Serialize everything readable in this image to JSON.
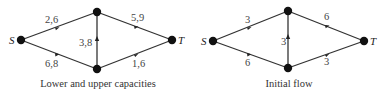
{
  "diagrams": [
    {
      "caption": "Lower and upper capacities",
      "nodes": [
        {
          "id": "S",
          "label": "S",
          "x": 21,
          "y": 40
        },
        {
          "id": "A",
          "label": "",
          "x": 97,
          "y": 12
        },
        {
          "id": "B",
          "label": "",
          "x": 97,
          "y": 69
        },
        {
          "id": "T",
          "label": "T",
          "x": 172,
          "y": 40
        }
      ],
      "edges": [
        {
          "from": "S",
          "to": "A",
          "label": "2,6"
        },
        {
          "from": "S",
          "to": "B",
          "label": "6,8"
        },
        {
          "from": "B",
          "to": "A",
          "label": "3,8"
        },
        {
          "from": "A",
          "to": "T",
          "label": "5,9"
        },
        {
          "from": "B",
          "to": "T",
          "label": "1,6"
        }
      ]
    },
    {
      "caption": "Initial flow",
      "nodes": [
        {
          "id": "S",
          "label": "S",
          "x": 213,
          "y": 41
        },
        {
          "id": "A",
          "label": "",
          "x": 288,
          "y": 11
        },
        {
          "id": "B",
          "label": "",
          "x": 288,
          "y": 68
        },
        {
          "id": "T",
          "label": "T",
          "x": 364,
          "y": 41
        }
      ],
      "edges": [
        {
          "from": "S",
          "to": "A",
          "label": "3"
        },
        {
          "from": "S",
          "to": "B",
          "label": "6"
        },
        {
          "from": "B",
          "to": "A",
          "label": "3"
        },
        {
          "from": "A",
          "to": "T",
          "label": "6"
        },
        {
          "from": "B",
          "to": "T",
          "label": "3"
        }
      ]
    }
  ]
}
